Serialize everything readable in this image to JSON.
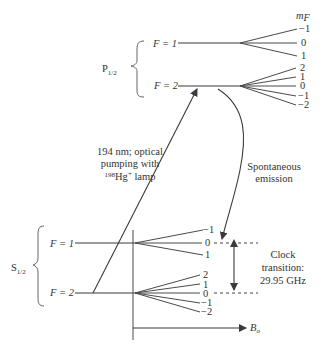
{
  "diagram": {
    "title": "",
    "type": "energy-level diagram (199Hg+ hyperfine structure)",
    "mF_header": "m",
    "mF_header_sub": "F",
    "p_state": {
      "label": "P",
      "label_sub": "1/2",
      "levels": [
        {
          "label": "F = 1",
          "sublevels": [
            "−1",
            "0",
            "1"
          ]
        },
        {
          "label": "F = 2",
          "sublevels": [
            "2",
            "1",
            "0",
            "−1",
            "−2"
          ]
        }
      ]
    },
    "s_state": {
      "label": "S",
      "label_sub": "1/2",
      "levels": [
        {
          "label": "F = 1",
          "sublevels": [
            "−1",
            "0",
            "1"
          ]
        },
        {
          "label": "F = 2",
          "sublevels": [
            "2",
            "1",
            "0",
            "−1",
            "−2"
          ]
        }
      ]
    },
    "pumping": {
      "line1": "194 nm; optical",
      "line2": "pumping with",
      "iso": "198",
      "element": "Hg",
      "charge": "+",
      "lamp": " lamp"
    },
    "emission": {
      "line1": "Spontaneous",
      "line2": "emission"
    },
    "clock": {
      "line1": "Clock",
      "line2": "transition:",
      "line3": "29.95 GHz"
    },
    "field_axis": {
      "label": "B",
      "label_sub": "o"
    }
  }
}
